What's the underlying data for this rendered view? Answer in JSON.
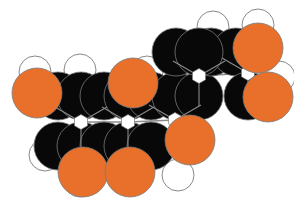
{
  "figure": {
    "type": "cpk-space-filling-model",
    "width": 294,
    "height": 213,
    "background_color": "#ffffff"
  },
  "palette": {
    "carbon": "#080808",
    "oxygen": "#E8702A",
    "hydrogen": "#ffffff",
    "outline": "#7a7a7a",
    "bond_line": "#8a8a8a"
  },
  "legend": {
    "carbon_label": "C",
    "oxygen_label": "O",
    "hydrogen_label": "H"
  },
  "counts": {
    "carbon": 17,
    "oxygen": 7,
    "hydrogen": 11
  },
  "ring_junctions": [
    {
      "id": "j1",
      "x": 81,
      "y": 122
    },
    {
      "id": "j2",
      "x": 128,
      "y": 122
    },
    {
      "id": "j3",
      "x": 175,
      "y": 120
    },
    {
      "id": "j4",
      "x": 199,
      "y": 76
    },
    {
      "id": "j5",
      "x": 248,
      "y": 73
    }
  ],
  "atoms": [
    {
      "id": "h1",
      "element": "H",
      "x": 35,
      "y": 72,
      "r": 16,
      "layer": 0
    },
    {
      "id": "h2",
      "element": "H",
      "x": 80,
      "y": 70,
      "r": 16,
      "layer": 0
    },
    {
      "id": "h3",
      "element": "H",
      "x": 147,
      "y": 72,
      "r": 16,
      "layer": 0
    },
    {
      "id": "h4",
      "element": "H",
      "x": 178,
      "y": 53,
      "r": 16,
      "layer": 0
    },
    {
      "id": "h5",
      "element": "H",
      "x": 213,
      "y": 27,
      "r": 16,
      "layer": 0
    },
    {
      "id": "h6",
      "element": "H",
      "x": 258,
      "y": 25,
      "r": 16,
      "layer": 0
    },
    {
      "id": "h7",
      "element": "H",
      "x": 279,
      "y": 77,
      "r": 16,
      "layer": 0
    },
    {
      "id": "h8",
      "element": "H",
      "x": 45,
      "y": 155,
      "r": 16,
      "layer": 0
    },
    {
      "id": "h9",
      "element": "H",
      "x": 80,
      "y": 181,
      "r": 16,
      "layer": 0
    },
    {
      "id": "h10",
      "element": "H",
      "x": 196,
      "y": 138,
      "r": 17,
      "layer": 0
    },
    {
      "id": "h11",
      "element": "H",
      "x": 178,
      "y": 175,
      "r": 16,
      "layer": 0
    },
    {
      "id": "c1",
      "element": "C",
      "x": 58,
      "y": 96,
      "r": 24,
      "layer": 1
    },
    {
      "id": "c2",
      "element": "C",
      "x": 81,
      "y": 96,
      "r": 24,
      "layer": 1
    },
    {
      "id": "c3",
      "element": "C",
      "x": 104,
      "y": 96,
      "r": 24,
      "layer": 1
    },
    {
      "id": "c4",
      "element": "C",
      "x": 128,
      "y": 96,
      "r": 24,
      "layer": 1
    },
    {
      "id": "c5",
      "element": "C",
      "x": 151,
      "y": 96,
      "r": 24,
      "layer": 1
    },
    {
      "id": "c6",
      "element": "C",
      "x": 176,
      "y": 96,
      "r": 24,
      "layer": 1
    },
    {
      "id": "c7",
      "element": "C",
      "x": 199,
      "y": 96,
      "r": 24,
      "layer": 1
    },
    {
      "id": "c8",
      "element": "C",
      "x": 176,
      "y": 52,
      "r": 24,
      "layer": 1
    },
    {
      "id": "c9",
      "element": "C",
      "x": 211,
      "y": 52,
      "r": 24,
      "layer": 1
    },
    {
      "id": "c10",
      "element": "C",
      "x": 236,
      "y": 52,
      "r": 24,
      "layer": 1
    },
    {
      "id": "c11",
      "element": "C",
      "x": 248,
      "y": 96,
      "r": 24,
      "layer": 1
    },
    {
      "id": "c12",
      "element": "C",
      "x": 58,
      "y": 146,
      "r": 24,
      "layer": 1
    },
    {
      "id": "c13",
      "element": "C",
      "x": 81,
      "y": 146,
      "r": 24,
      "layer": 1
    },
    {
      "id": "c14",
      "element": "C",
      "x": 104,
      "y": 146,
      "r": 24,
      "layer": 1
    },
    {
      "id": "c15",
      "element": "C",
      "x": 128,
      "y": 146,
      "r": 24,
      "layer": 1
    },
    {
      "id": "c16",
      "element": "C",
      "x": 151,
      "y": 146,
      "r": 24,
      "layer": 1
    },
    {
      "id": "c17",
      "element": "C",
      "x": 199,
      "y": 52,
      "r": 24,
      "layer": 1
    },
    {
      "id": "o1",
      "element": "O",
      "x": 37,
      "y": 93,
      "r": 25,
      "layer": 2
    },
    {
      "id": "o2",
      "element": "O",
      "x": 133,
      "y": 83,
      "r": 25,
      "layer": 2
    },
    {
      "id": "o3",
      "element": "O",
      "x": 258,
      "y": 48,
      "r": 25,
      "layer": 2
    },
    {
      "id": "o4",
      "element": "O",
      "x": 268,
      "y": 97,
      "r": 25,
      "layer": 2
    },
    {
      "id": "o5",
      "element": "O",
      "x": 190,
      "y": 140,
      "r": 25,
      "layer": 2
    },
    {
      "id": "o6",
      "element": "O",
      "x": 83,
      "y": 172,
      "r": 25,
      "layer": 2
    },
    {
      "id": "o7",
      "element": "O",
      "x": 130,
      "y": 172,
      "r": 25,
      "layer": 2
    }
  ],
  "bonds": [
    {
      "from": "j1",
      "to": "j2"
    },
    {
      "from": "j2",
      "to": "j3"
    },
    {
      "from": "j3",
      "to": "j4"
    },
    {
      "from": "j4",
      "to": "j5"
    }
  ]
}
